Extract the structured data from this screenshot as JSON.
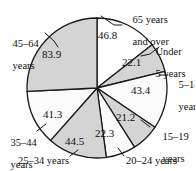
{
  "chart_data": {
    "type": "pie",
    "title": "",
    "subtitle": "",
    "xlabel": "",
    "ylabel": "",
    "grid": false,
    "legend_position": "none",
    "label_style": "leader-lines-outside",
    "total": 325.5,
    "units": "millions",
    "start_angle_deg": 0,
    "direction": "clockwise",
    "categories": [
      "65 years and over",
      "Under 5 years",
      "5–14 years",
      "15–19 years",
      "20–24 years",
      "25–34 years",
      "35–44 years",
      "45–64 years"
    ],
    "values": [
      46.8,
      22.1,
      43.4,
      21.2,
      22.3,
      44.5,
      41.3,
      83.9
    ],
    "slices": [
      {
        "label": "65 years and over",
        "value": "46.8",
        "value_num": 46.8,
        "fill": "#ffffff",
        "angle_deg": 51.8
      },
      {
        "label": "Under 5 years",
        "value": "22.1",
        "value_num": 22.1,
        "fill": "#d4d4d4",
        "angle_deg": 24.4
      },
      {
        "label": "5–14 years",
        "value": "43.4",
        "value_num": 43.4,
        "fill": "#fbfbfb",
        "angle_deg": 48.0
      },
      {
        "label": "15–19 years",
        "value": "21.2",
        "value_num": 21.2,
        "fill": "#d4d4d4",
        "angle_deg": 23.5
      },
      {
        "label": "20–24 years",
        "value": "22.3",
        "value_num": 22.3,
        "fill": "#fbfbfb",
        "angle_deg": 24.7
      },
      {
        "label": "25–34 years",
        "value": "44.5",
        "value_num": 44.5,
        "fill": "#d4d4d4",
        "angle_deg": 49.2
      },
      {
        "label": "35–44 years",
        "value": "41.3",
        "value_num": 41.3,
        "fill": "#fbfbfb",
        "angle_deg": 45.7
      },
      {
        "label": "45–64 years",
        "value": "83.9",
        "value_num": 83.9,
        "fill": "#d4d4d4",
        "angle_deg": 92.8
      }
    ],
    "colors": {
      "shaded": "#d4d4d4",
      "unshaded": "#fbfbfb",
      "outline": "#1a1a1a",
      "text": "#111111"
    }
  },
  "labels": {
    "l_65_line1": "65 years",
    "l_65_line2": "and over",
    "l_under5_line1": "Under",
    "l_under5_line2": "5 years",
    "l_5_14_line1": "5–14",
    "l_5_14_line2": "years",
    "l_15_19_line1": "15–19",
    "l_15_19_line2": "years",
    "l_20_24": "20–24 years",
    "l_25_34": "25–34 years",
    "l_35_44_line1": "35–44",
    "l_35_44_line2": "years",
    "l_45_64_line1": "45–64",
    "l_45_64_line2": "years"
  },
  "values": {
    "v_65": "46.8",
    "v_under5": "22.1",
    "v_5_14": "43.4",
    "v_15_19": "21.2",
    "v_20_24": "22.3",
    "v_25_34": "44.5",
    "v_35_44": "41.3",
    "v_45_64": "83.9"
  }
}
